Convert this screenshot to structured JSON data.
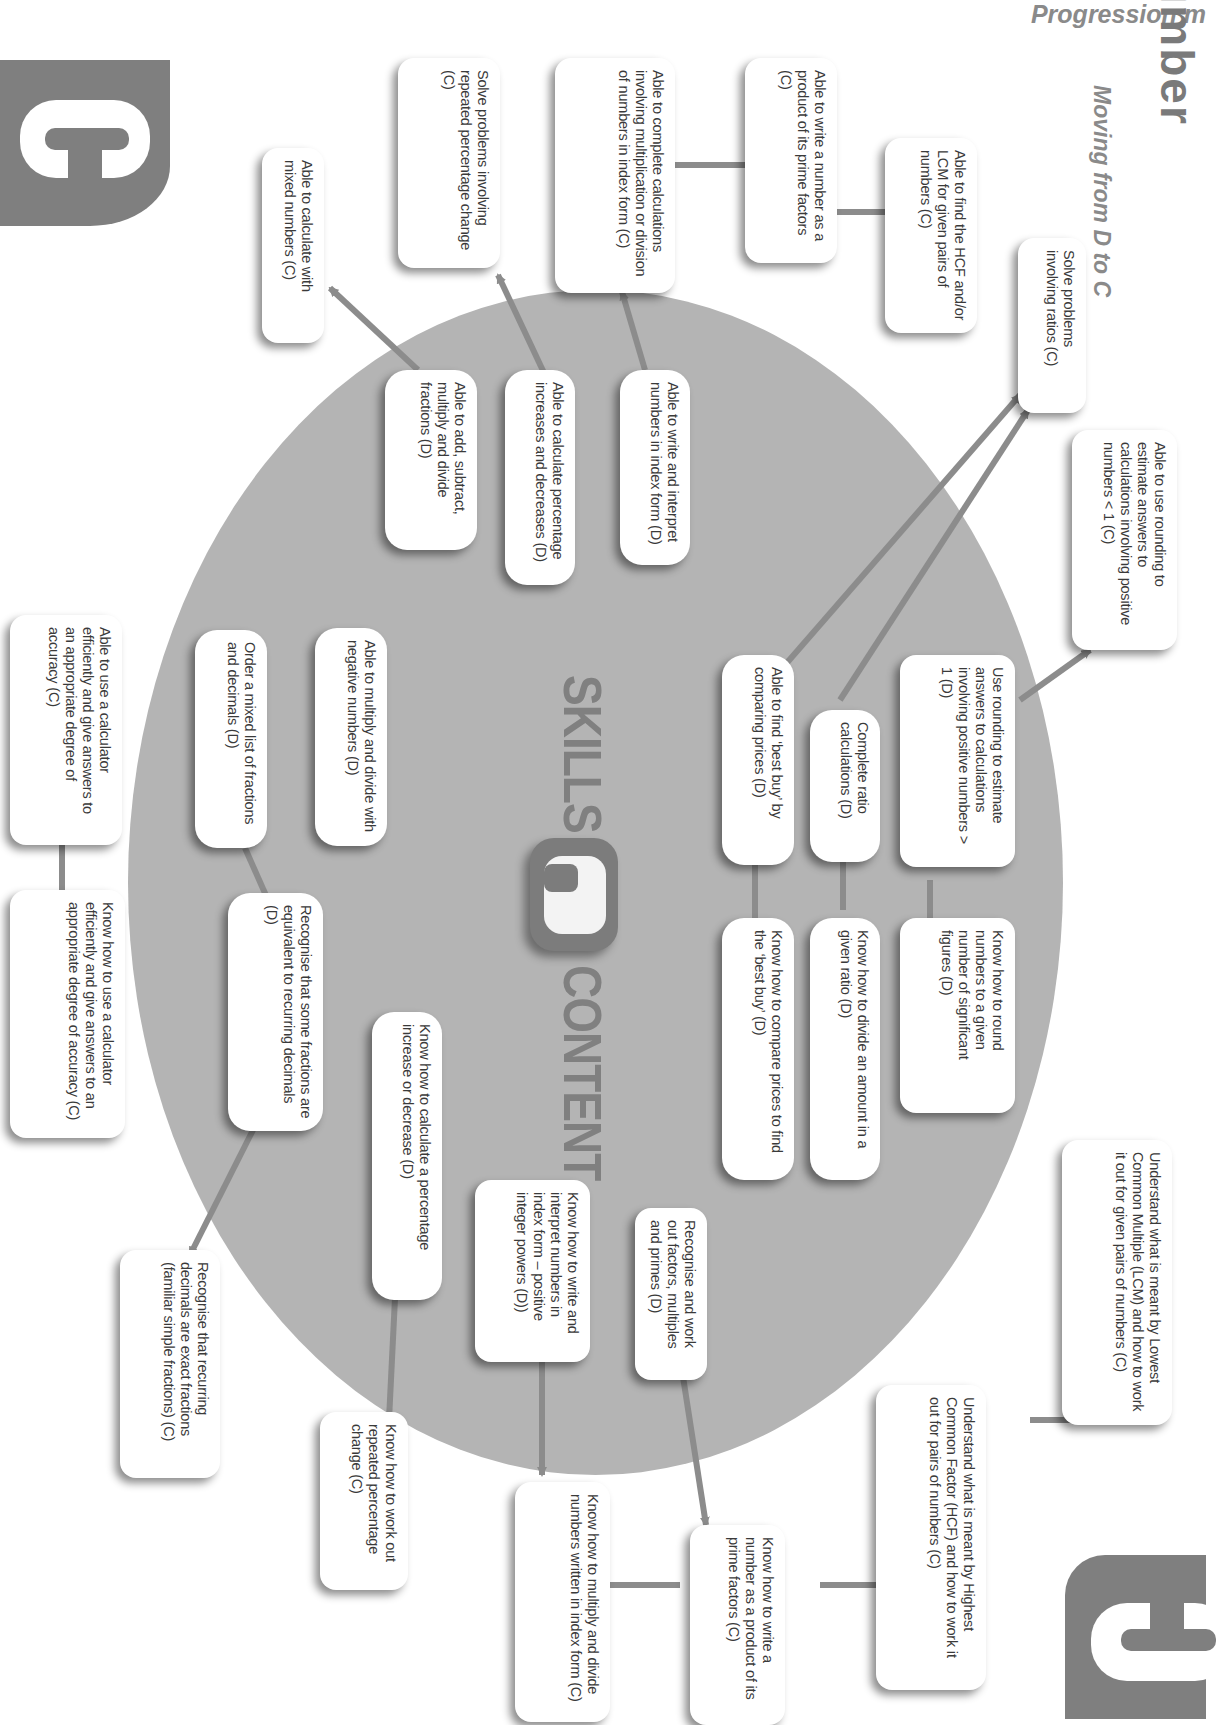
{
  "header": {
    "running_title": "Progression m",
    "title": "Number",
    "subtitle": "Moving from D to C"
  },
  "badges": {
    "top_left_grade": "C",
    "bottom_right_grade": "C",
    "center_grade": "D"
  },
  "center_labels": {
    "skills": "SKILLS",
    "content": "CONTENT"
  },
  "colors": {
    "ellipse": "#b4b4b4",
    "badge": "#7f7f7f",
    "arrow": "#8c8c8c",
    "box": "#ffffff",
    "text": "#3a3a3a"
  },
  "skills_c": [
    {
      "id": "mixed-numbers",
      "text": "Able to calculate with mixed numbers  (C)"
    },
    {
      "id": "repeated-percentage",
      "text": "Solve problems involving repeated percentage change  (C)"
    },
    {
      "id": "index-calc",
      "text": "Able to complete calculations involving multiplication or division of numbers in index form  (C)"
    },
    {
      "id": "prime-factors",
      "text": "Able to write a number as a product of its prime factors  (C)"
    },
    {
      "id": "hcf-lcm",
      "text": "Able to find the HCF and/or LCM for given pairs of numbers  (C)"
    },
    {
      "id": "ratios",
      "text": "Solve problems involving ratios  (C)"
    },
    {
      "id": "rounding-lt1",
      "text": "Able to use rounding to estimate answers to calculations involving positive numbers < 1  (C)"
    },
    {
      "id": "calculator",
      "text": "Able to use a calculator efficiently and give answers to an appropriate degree of accuracy  (C)"
    }
  ],
  "skills_d": [
    {
      "id": "add-fractions",
      "text": "Able to add, subtract, multiply and divide fractions  (D)"
    },
    {
      "id": "percentage-inc-dec",
      "text": "Able to calculate percentage increases and decreases  (D)"
    },
    {
      "id": "index-form",
      "text": "Able to write and interpret numbers in index form  (D)"
    },
    {
      "id": "negative-numbers",
      "text": "Able to multiply and divide with negative numbers  (D)"
    },
    {
      "id": "order-fractions",
      "text": "Order a mixed list of fractions and decimals  (D)"
    },
    {
      "id": "best-buy",
      "text": "Able to find ‘best buy’ by comparing prices  (D)"
    },
    {
      "id": "ratio-calcs",
      "text": "Complete ratio calculations  (D)"
    },
    {
      "id": "rounding-gt1",
      "text": "Use rounding to estimate answers to calculations involving positive numbers > 1  (D)"
    }
  ],
  "content_d": [
    {
      "id": "round-sig-figs",
      "text": "Know how to round numbers to a given number of significant figures  (D)"
    },
    {
      "id": "divide-ratio",
      "text": "Know how to divide an amount in a given ratio  (D)"
    },
    {
      "id": "compare-prices",
      "text": "Know how to compare prices to find the ‘best buy’  (D)"
    },
    {
      "id": "recurring-equivalent",
      "text": "Recognise that some fractions are equivalent to recurring decimals  (D)"
    },
    {
      "id": "calc-percentage",
      "text": "Know how to calculate a percentage increase or decrease  (D)"
    },
    {
      "id": "index-positive-powers",
      "text": "Know how to write and interpret numbers in index form – positive integer powers  (D))"
    },
    {
      "id": "factors-multiples",
      "text": "Recognise and work out factors, multiples and primes  (D)"
    }
  ],
  "content_c": [
    {
      "id": "lcm-meaning",
      "text": "Understand what is meant by Lowest Common Multiple (LCM) and how to work it out for given pairs of numbers  (C)"
    },
    {
      "id": "hcf-meaning",
      "text": "Understand what is meant by Highest Common Factor (HCF) and how to work it out for pairs of numbers  (C)"
    },
    {
      "id": "prime-product",
      "text": "Know how to write a number as a product of its prime factors  (C)"
    },
    {
      "id": "multiply-index",
      "text": "Know how to multiply and divide numbers written in index form  (C)"
    },
    {
      "id": "repeated-change",
      "text": "Know how to work out repeated percentage change  (C)"
    },
    {
      "id": "recurring-exact",
      "text": "Recognise that recurring decimals are exact fractions (familiar simple fractions)  (C)"
    },
    {
      "id": "calculator-know",
      "text": "Know how to use a calculator efficiently and give answers to an appropriate degree of accuracy  (C)"
    }
  ]
}
